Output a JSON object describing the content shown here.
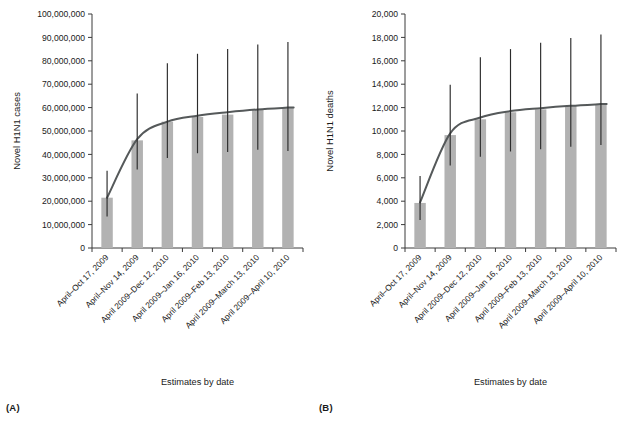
{
  "figure": {
    "background_color": "#ffffff",
    "bar_color": "#b2b2b2",
    "curve_color": "#55595a",
    "error_bar_color": "#2b2b2b",
    "axis_color": "#3a3a3a"
  },
  "panels": [
    {
      "tag": "(A)",
      "ylabel": "Novel H1N1 cases",
      "xlabel": "Estimates by date"
    },
    {
      "tag": "(B)",
      "ylabel": "Novel H1N1 deaths",
      "xlabel": "Estimates by date"
    }
  ],
  "chart_data": [
    {
      "type": "bar",
      "title": "",
      "panel": "(A)",
      "xlabel": "Estimates by date",
      "ylabel": "Novel H1N1 cases",
      "ylim": [
        0,
        100000000
      ],
      "ytick_values": [
        0,
        10000000,
        20000000,
        30000000,
        40000000,
        50000000,
        60000000,
        70000000,
        80000000,
        90000000,
        100000000
      ],
      "ytick_labels": [
        "0",
        "10,000,000",
        "20,000,000",
        "30,000,000",
        "40,000,000",
        "50,000,000",
        "60,000,000",
        "70,000,000",
        "80,000,000",
        "90,000,000",
        "100,000,000"
      ],
      "grid": false,
      "legend": "none",
      "categories": [
        "April–Oct 17, 2009",
        "April–Nov 14, 2009",
        "April 2009–Dec 12, 2010",
        "April 2009–Jan 16, 2010",
        "April 2009–Feb 13, 2010",
        "April 2009–March 13, 2010",
        "April 2009–April 10, 2010"
      ],
      "values": [
        21500000,
        46000000,
        54000000,
        56000000,
        57000000,
        59000000,
        60000000
      ],
      "error_low": [
        13500000,
        33500000,
        38500000,
        40500000,
        41000000,
        42000000,
        41500000
      ],
      "error_high": [
        33000000,
        66000000,
        79000000,
        83000000,
        85000000,
        87000000,
        88000000
      ],
      "fit_curve": {
        "name": "fitted trend",
        "x": [
          0,
          1,
          2,
          3,
          4,
          5,
          6
        ],
        "y": [
          21500000,
          46500000,
          54000000,
          56500000,
          58000000,
          59200000,
          60000000
        ]
      }
    },
    {
      "type": "bar",
      "title": "",
      "panel": "(B)",
      "xlabel": "Estimates by date",
      "ylabel": "Novel H1N1 deaths",
      "ylim": [
        0,
        20000
      ],
      "ytick_values": [
        0,
        2000,
        4000,
        6000,
        8000,
        10000,
        12000,
        14000,
        16000,
        18000,
        20000
      ],
      "ytick_labels": [
        "0",
        "2,000",
        "4,000",
        "6,000",
        "8,000",
        "10,000",
        "12,000",
        "14,000",
        "16,000",
        "18,000",
        "20,000"
      ],
      "grid": false,
      "legend": "none",
      "categories": [
        "April–Oct 17, 2009",
        "April–Nov 14, 2009",
        "April 2009–Dec 12, 2010",
        "April 2009–Jan 16, 2010",
        "April 2009–Feb 13, 2010",
        "April 2009–March 13, 2010",
        "April 2009–April 10, 2010"
      ],
      "values": [
        3850,
        9650,
        11000,
        11600,
        11850,
        12150,
        12300
      ],
      "error_low": [
        2400,
        7050,
        7800,
        8250,
        8450,
        8650,
        8800
      ],
      "error_high": [
        6150,
        13950,
        16300,
        17000,
        17550,
        17950,
        18250
      ],
      "fit_curve": {
        "name": "fitted trend",
        "x": [
          0,
          1,
          2,
          3,
          4,
          5,
          6
        ],
        "y": [
          3900,
          9800,
          11150,
          11700,
          11950,
          12150,
          12300
        ]
      }
    }
  ]
}
